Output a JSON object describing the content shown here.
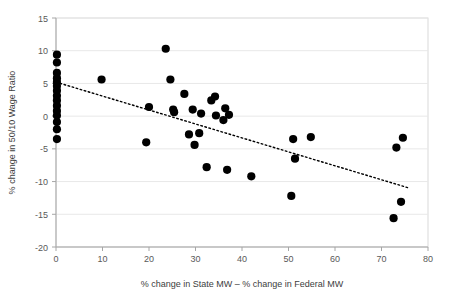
{
  "chart_data": {
    "type": "scatter",
    "title": "",
    "xlabel": "% change in State MW – % change in Federal MW",
    "ylabel": "% change in 50/10 Wage Ratio",
    "xlim": [
      0,
      80
    ],
    "ylim": [
      -20,
      15
    ],
    "xticks": [
      0,
      10,
      20,
      30,
      40,
      50,
      60,
      70,
      80
    ],
    "yticks": [
      -20,
      -15,
      -10,
      -5,
      0,
      5,
      10,
      15
    ],
    "grid": false,
    "legend": null,
    "marker_color": "#000000",
    "trendline": {
      "style": "dotted",
      "color": "#000000",
      "x_start": 0,
      "y_start": 5.2,
      "x_end": 76,
      "y_end": -11.0
    },
    "points": [
      {
        "x": 0.2,
        "y": 9.4
      },
      {
        "x": 0.2,
        "y": 8.2
      },
      {
        "x": 0.2,
        "y": 6.6
      },
      {
        "x": 0.2,
        "y": 5.8
      },
      {
        "x": 0.2,
        "y": 5.2
      },
      {
        "x": 0.2,
        "y": 4.6
      },
      {
        "x": 0.2,
        "y": 3.9
      },
      {
        "x": 0.2,
        "y": 3.1
      },
      {
        "x": 0.2,
        "y": 2.4
      },
      {
        "x": 0.2,
        "y": 1.6
      },
      {
        "x": 0.2,
        "y": 0.8
      },
      {
        "x": 0.2,
        "y": 0.1
      },
      {
        "x": 0.2,
        "y": -0.9
      },
      {
        "x": 0.2,
        "y": -2.0
      },
      {
        "x": 0.2,
        "y": -3.5
      },
      {
        "x": 9.8,
        "y": 5.6
      },
      {
        "x": 19.4,
        "y": -4.0
      },
      {
        "x": 20.0,
        "y": 1.4
      },
      {
        "x": 23.6,
        "y": 10.3
      },
      {
        "x": 24.6,
        "y": 5.6
      },
      {
        "x": 25.2,
        "y": 1.0
      },
      {
        "x": 25.4,
        "y": 0.6
      },
      {
        "x": 27.6,
        "y": 3.4
      },
      {
        "x": 28.6,
        "y": -2.8
      },
      {
        "x": 29.4,
        "y": 1.0
      },
      {
        "x": 29.8,
        "y": -4.4
      },
      {
        "x": 30.8,
        "y": -2.6
      },
      {
        "x": 31.2,
        "y": 0.4
      },
      {
        "x": 32.4,
        "y": -7.8
      },
      {
        "x": 33.4,
        "y": 2.4
      },
      {
        "x": 34.2,
        "y": 3.0
      },
      {
        "x": 34.4,
        "y": 0.1
      },
      {
        "x": 36.0,
        "y": -0.6
      },
      {
        "x": 36.4,
        "y": 1.2
      },
      {
        "x": 36.8,
        "y": -8.2
      },
      {
        "x": 37.2,
        "y": 0.2
      },
      {
        "x": 42.0,
        "y": -9.2
      },
      {
        "x": 50.6,
        "y": -12.2
      },
      {
        "x": 51.0,
        "y": -3.5
      },
      {
        "x": 51.4,
        "y": -6.5
      },
      {
        "x": 54.8,
        "y": -3.2
      },
      {
        "x": 72.6,
        "y": -15.6
      },
      {
        "x": 73.2,
        "y": -4.8
      },
      {
        "x": 74.2,
        "y": -13.1
      },
      {
        "x": 74.6,
        "y": -3.3
      }
    ]
  }
}
